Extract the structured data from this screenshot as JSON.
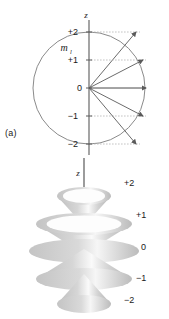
{
  "figure": {
    "background": "#ffffff",
    "ink": "#1a1a1a",
    "line_color": "#6e6e6e",
    "dotted_color": "#b5b5b5",
    "cone_fill": "#c9c9c9",
    "cone_light": "#f2f2f2"
  },
  "panel_a": {
    "caption": "(a)",
    "axis_label": "z",
    "quantum_symbol": "m",
    "quantum_subscript": "l",
    "circle": {
      "cx": 89,
      "cy": 88,
      "r": 56
    },
    "tick_labels": [
      "+2",
      "+1",
      "0",
      "-1",
      "-2"
    ],
    "levels": [
      {
        "label": "+2",
        "m": 2,
        "y": 32,
        "x_label": 78,
        "tip_x": 136,
        "tip_y": 32,
        "dash_end": 140
      },
      {
        "label": "+1",
        "m": 1,
        "y": 60,
        "x_label": 78,
        "tip_x": 143,
        "tip_y": 60,
        "dash_end": 146
      },
      {
        "label": "0",
        "m": 0,
        "y": 88,
        "x_label": 82,
        "tip_x": 146,
        "tip_y": 88,
        "dash_end": 146
      },
      {
        "label": "-1",
        "m": -1,
        "y": 116,
        "x_label": 78,
        "tip_x": 143,
        "tip_y": 116,
        "dash_end": 146
      },
      {
        "label": "-2",
        "m": -2,
        "y": 144,
        "x_label": 78,
        "tip_x": 136,
        "tip_y": 144,
        "dash_end": 140
      }
    ],
    "origin": {
      "x": 89,
      "y": 88
    },
    "axis_top_y": 20,
    "axis_bottom_y": 155
  },
  "panel_b": {
    "caption": "(b)",
    "axis_label": "z",
    "labels": [
      "+2",
      "+1",
      "0",
      "-1",
      "-2"
    ],
    "cones": [
      {
        "label": "+2",
        "m": 2,
        "cy": 196,
        "rx": 27,
        "ry": 9,
        "label_x": 124,
        "label_y": 186
      },
      {
        "label": "+1",
        "m": 1,
        "cy": 224,
        "rx": 48,
        "ry": 11,
        "label_x": 136,
        "label_y": 218
      },
      {
        "label": "0",
        "m": 0,
        "cy": 251,
        "rx": 55,
        "ry": 12,
        "label_x": 141,
        "label_y": 250
      },
      {
        "label": "-1",
        "m": -1,
        "cy": 279,
        "rx": 48,
        "ry": 11,
        "label_x": 136,
        "label_y": 281
      },
      {
        "label": "-2",
        "m": -2,
        "cy": 304,
        "rx": 27,
        "ry": 9,
        "label_x": 124,
        "label_y": 303
      }
    ],
    "axis_x": 84,
    "axis_top_y": 158,
    "axis_bottom_y": 300
  },
  "chart_data": {
    "type": "scatter",
    "categories": [
      "+2",
      "+1",
      "0",
      "-1",
      "-2"
    ],
    "values": [
      2,
      1,
      0,
      -1,
      -2
    ],
    "xlabel": "",
    "ylabel": "z",
    "ylim": [
      -2,
      2
    ],
    "series": [
      {
        "name": "m_l projection (panel a vectors)",
        "values": [
          2,
          1,
          0,
          -1,
          -2
        ]
      },
      {
        "name": "precession cones (panel b)",
        "values": [
          2,
          1,
          0,
          -1,
          -2
        ]
      }
    ],
    "annotations": [
      "(a)",
      "(b)",
      "m_l",
      "z"
    ],
    "grid": false,
    "legend": "none"
  }
}
